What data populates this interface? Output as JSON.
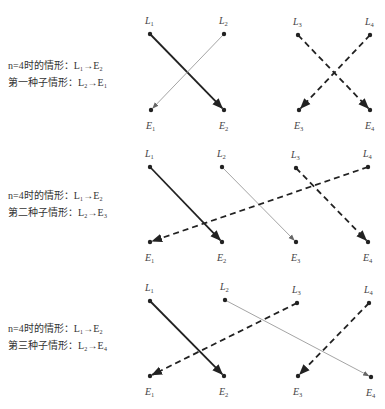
{
  "colors": {
    "thick": "#222222",
    "thin": "#9a9a9a",
    "dashed": "#222222",
    "node": "#222222"
  },
  "panels": [
    {
      "caption": {
        "line1": "n=4时的情形：L₁→E₂",
        "line2": "第一种子情形：L₂→E₁"
      },
      "nodes_top": [
        {
          "label": "L",
          "sub": "1",
          "x": 150,
          "y": 34
        },
        {
          "label": "L",
          "sub": "2",
          "x": 224,
          "y": 34
        },
        {
          "label": "L",
          "sub": "3",
          "x": 298,
          "y": 35
        },
        {
          "label": "L",
          "sub": "4",
          "x": 370,
          "y": 35
        }
      ],
      "nodes_bottom": [
        {
          "label": "E",
          "sub": "1",
          "x": 151,
          "y": 110
        },
        {
          "label": "E",
          "sub": "2",
          "x": 224,
          "y": 110
        },
        {
          "label": "E",
          "sub": "3",
          "x": 299,
          "y": 110
        },
        {
          "label": "E",
          "sub": "4",
          "x": 370,
          "y": 110
        }
      ],
      "edges": [
        {
          "from": "L1",
          "to": "E2",
          "style": "thick"
        },
        {
          "from": "L2",
          "to": "E1",
          "style": "thin"
        },
        {
          "from": "L3",
          "to": "E4",
          "style": "dashed"
        },
        {
          "from": "L4",
          "to": "E3",
          "style": "dashed"
        }
      ]
    },
    {
      "caption": {
        "line1": "n=4时的情形：L₁→E₂",
        "line2": "第二种子情形：L₂→E₃"
      },
      "nodes_top": [
        {
          "label": "L",
          "sub": "1",
          "x": 150,
          "y": 167
        },
        {
          "label": "L",
          "sub": "2",
          "x": 222,
          "y": 167
        },
        {
          "label": "L",
          "sub": "3",
          "x": 296,
          "y": 168
        },
        {
          "label": "L",
          "sub": "4",
          "x": 368,
          "y": 167
        }
      ],
      "nodes_bottom": [
        {
          "label": "E",
          "sub": "1",
          "x": 150,
          "y": 242
        },
        {
          "label": "E",
          "sub": "2",
          "x": 222,
          "y": 242
        },
        {
          "label": "E",
          "sub": "3",
          "x": 296,
          "y": 242
        },
        {
          "label": "E",
          "sub": "4",
          "x": 368,
          "y": 242
        }
      ],
      "edges": [
        {
          "from": "L1",
          "to": "E2",
          "style": "thick"
        },
        {
          "from": "L2",
          "to": "E3",
          "style": "thin"
        },
        {
          "from": "L3",
          "to": "E4",
          "style": "dashed"
        },
        {
          "from": "L4",
          "to": "E1",
          "style": "dashed"
        }
      ]
    },
    {
      "caption": {
        "line1": "n=4时的情形：L₁→E₂",
        "line2": "第三种子情形：L₂→E₄"
      },
      "nodes_top": [
        {
          "label": "L",
          "sub": "1",
          "x": 150,
          "y": 301
        },
        {
          "label": "L",
          "sub": "2",
          "x": 225,
          "y": 300
        },
        {
          "label": "L",
          "sub": "3",
          "x": 297,
          "y": 303
        },
        {
          "label": "L",
          "sub": "4",
          "x": 369,
          "y": 303
        }
      ],
      "nodes_bottom": [
        {
          "label": "E",
          "sub": "1",
          "x": 150,
          "y": 376
        },
        {
          "label": "E",
          "sub": "2",
          "x": 224,
          "y": 376
        },
        {
          "label": "E",
          "sub": "3",
          "x": 298,
          "y": 376
        },
        {
          "label": "E",
          "sub": "4",
          "x": 371,
          "y": 377
        }
      ],
      "edges": [
        {
          "from": "L1",
          "to": "E2",
          "style": "thick"
        },
        {
          "from": "L2",
          "to": "E4",
          "style": "thin"
        },
        {
          "from": "L3",
          "to": "E1",
          "style": "dashed"
        },
        {
          "from": "L4",
          "to": "E3",
          "style": "dashed"
        }
      ]
    }
  ]
}
